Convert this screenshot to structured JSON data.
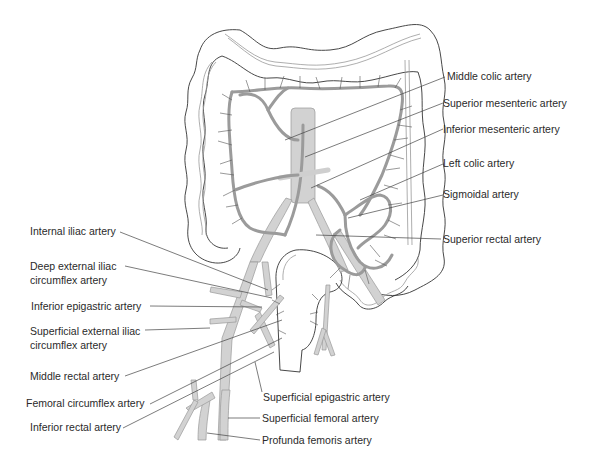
{
  "figure": {
    "colors": {
      "vessel_fill": "#c9c9c9",
      "vessel_dark": "#a8a8a8",
      "outline": "#333333",
      "leader_line": "#444444",
      "background": "#ffffff"
    }
  },
  "labels": {
    "right": [
      {
        "text": "Middle colic artery"
      },
      {
        "text": "Superior mesenteric artery"
      },
      {
        "text": "Inferior mesenteric artery"
      },
      {
        "text": "Left colic artery"
      },
      {
        "text": "Sigmoidal artery"
      },
      {
        "text": "Superior rectal artery"
      }
    ],
    "left": [
      {
        "text": "Internal iliac artery"
      },
      {
        "text": "Deep external iliac circumflex artery"
      },
      {
        "text": "Inferior epigastric artery"
      },
      {
        "text": "Superficial external iliac circumflex artery"
      },
      {
        "text": "Middle rectal artery"
      },
      {
        "text": "Femoral circumflex artery"
      },
      {
        "text": "Inferior rectal artery"
      }
    ],
    "bottom": [
      {
        "text": "Superficial  epigastric artery"
      },
      {
        "text": "Superficial femoral artery"
      },
      {
        "text": "Profunda femoris artery"
      }
    ]
  }
}
